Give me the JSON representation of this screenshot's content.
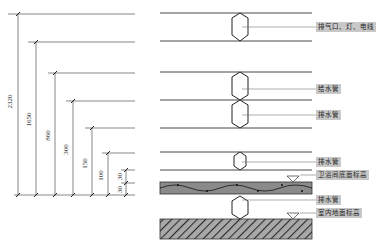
{
  "diagram": {
    "title": "",
    "dimensions": [
      {
        "value": "2320",
        "x": 18,
        "top": 14,
        "bottom": 195
      },
      {
        "value": "1650",
        "x": 36,
        "top": 42,
        "bottom": 195
      },
      {
        "value": "860",
        "x": 55,
        "top": 73,
        "bottom": 195
      },
      {
        "value": "300",
        "x": 73,
        "top": 101,
        "bottom": 195
      },
      {
        "value": "150",
        "x": 92,
        "top": 128,
        "bottom": 195
      },
      {
        "value": "100",
        "x": 108,
        "top": 153,
        "bottom": 195
      },
      {
        "value": "30",
        "x": 126,
        "top": 170,
        "bottom": 183
      },
      {
        "value": "30",
        "x": 126,
        "top": 183,
        "bottom": 195
      }
    ],
    "labels": [
      {
        "text": "排气口、灯、电线",
        "x": 316,
        "y": 23
      },
      {
        "text": "给水管",
        "x": 316,
        "y": 85
      },
      {
        "text": "排水管",
        "x": 316,
        "y": 111
      },
      {
        "text": "排水管",
        "x": 316,
        "y": 158
      },
      {
        "text": "卫浴间底面标高",
        "x": 316,
        "y": 171
      },
      {
        "text": "排水管",
        "x": 316,
        "y": 197
      },
      {
        "text": "室内地面标高",
        "x": 316,
        "y": 209
      }
    ],
    "zones": [
      {
        "name": "exhaust-lights-wiring-zone"
      },
      {
        "name": "water-supply-zone"
      },
      {
        "name": "drain-zone"
      },
      {
        "name": "bathroom-drain-zone"
      },
      {
        "name": "bathroom-floor-slab"
      },
      {
        "name": "below-slab-drain"
      },
      {
        "name": "indoor-floor-slab"
      }
    ],
    "colors": {
      "line": "#444444",
      "label_bg": "#c8c8c8",
      "slab_fill": "#8a8a8a",
      "hatch_fill": "#9a9a9a"
    }
  }
}
